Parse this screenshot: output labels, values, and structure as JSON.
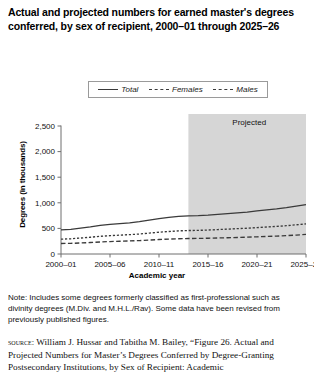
{
  "title": "Actual and projected numbers for earned master's degrees conferred, by sex of recipient, 2000–01 through 2025–26",
  "legend": {
    "items": [
      {
        "label": "Total",
        "style": "solid",
        "swatch_icon": "solid-line-icon"
      },
      {
        "label": "Females",
        "style": "short-dash",
        "swatch_icon": "short-dashed-line-icon"
      },
      {
        "label": "Males",
        "style": "long-dash",
        "swatch_icon": "long-dashed-line-icon"
      }
    ]
  },
  "annotations": {
    "projected_label": "Projected"
  },
  "notes": {
    "note": "Note: Includes some degrees formerly classified as first-professional such as divinity degrees (M.Div. and M.H.L./Rav). Some data have been revised from previously published figures.",
    "source_kicker": "source:",
    "source": "William J. Hussar and Tabitha M. Bailey, “Figure 26. Actual and Projected Numbers for Master’s Degrees Conferred by Degree-Granting Postsecondary Institutions, by Sex of Recipient: Academic"
  },
  "colors": {
    "line": "#3a3a3a",
    "axis": "#6f6f6f",
    "projected_band": "#d6d6d6",
    "text": "#111111"
  },
  "chart_data": {
    "type": "line",
    "title": "Actual and projected numbers for earned master's degrees conferred, by sex of recipient, 2000–01 through 2025–26",
    "xlabel": "Academic year",
    "ylabel": "Degrees (in thousands)",
    "ylim": [
      0,
      2500
    ],
    "yticks": [
      0,
      500,
      1000,
      1500,
      2000,
      2500
    ],
    "ytick_labels": [
      "0",
      "500",
      "1,000",
      "1,500",
      "2,000",
      "2,500"
    ],
    "xtick_labels": [
      "2000–01",
      "2005–06",
      "2010–11",
      "2015–16",
      "2020–21",
      "2025–26"
    ],
    "xticks": [
      2000,
      2005,
      2010,
      2015,
      2020,
      2025
    ],
    "xlim": [
      2000,
      2025
    ],
    "grid": false,
    "legend_position": "above-plot",
    "projection_starts": 2013,
    "projected_band_label": "Projected",
    "x": [
      2000,
      2001,
      2002,
      2003,
      2004,
      2005,
      2006,
      2007,
      2008,
      2009,
      2010,
      2011,
      2012,
      2013,
      2014,
      2015,
      2016,
      2017,
      2018,
      2019,
      2020,
      2021,
      2022,
      2023,
      2024,
      2025
    ],
    "series": [
      {
        "name": "Total",
        "style": "solid",
        "values": [
          470,
          482,
          505,
          530,
          560,
          580,
          595,
          610,
          630,
          660,
          690,
          715,
          735,
          745,
          750,
          760,
          775,
          790,
          805,
          820,
          840,
          860,
          880,
          905,
          935,
          965
        ]
      },
      {
        "name": "Females",
        "style": "short-dash",
        "values": [
          290,
          298,
          312,
          328,
          345,
          358,
          368,
          378,
          390,
          408,
          425,
          440,
          452,
          458,
          462,
          468,
          477,
          486,
          495,
          504,
          515,
          527,
          539,
          553,
          570,
          588
        ]
      },
      {
        "name": "Males",
        "style": "long-dash",
        "values": [
          205,
          208,
          215,
          224,
          235,
          243,
          249,
          255,
          262,
          272,
          283,
          292,
          298,
          302,
          305,
          308,
          313,
          318,
          323,
          329,
          336,
          343,
          350,
          359,
          370,
          382
        ]
      }
    ]
  }
}
